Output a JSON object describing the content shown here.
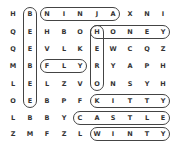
{
  "puzzle": {
    "type": "word-search",
    "rows": 8,
    "cols": 10,
    "grid": [
      [
        "H",
        "B",
        "N",
        "I",
        "N",
        "J",
        "A",
        "X",
        "N",
        "I"
      ],
      [
        "Q",
        "E",
        "H",
        "B",
        "O",
        "H",
        "O",
        "N",
        "E",
        "Y"
      ],
      [
        "Q",
        "E",
        "V",
        "L",
        "K",
        "E",
        "W",
        "C",
        "Q",
        "Z"
      ],
      [
        "M",
        "B",
        "F",
        "L",
        "Y",
        "R",
        "Y",
        "A",
        "P",
        "H"
      ],
      [
        "L",
        "E",
        "L",
        "Z",
        "V",
        "O",
        "N",
        "S",
        "Y",
        "H"
      ],
      [
        "O",
        "E",
        "B",
        "P",
        "F",
        "K",
        "I",
        "T",
        "T",
        "Y"
      ],
      [
        "L",
        "B",
        "B",
        "Y",
        "C",
        "A",
        "S",
        "T",
        "L",
        "E"
      ],
      [
        "Z",
        "M",
        "F",
        "Z",
        "L",
        "W",
        "I",
        "N",
        "T",
        "Y"
      ]
    ],
    "found_words": [
      {
        "word": "BEEBEE",
        "row": 0,
        "col": 1,
        "dir": "down",
        "len": 6
      },
      {
        "word": "NINJA",
        "row": 0,
        "col": 2,
        "dir": "right",
        "len": 5
      },
      {
        "word": "HERO",
        "row": 1,
        "col": 5,
        "dir": "down",
        "len": 4
      },
      {
        "word": "HONEY",
        "row": 1,
        "col": 5,
        "dir": "right",
        "len": 5
      },
      {
        "word": "FLY",
        "row": 3,
        "col": 2,
        "dir": "right",
        "len": 3
      },
      {
        "word": "KITTY",
        "row": 5,
        "col": 5,
        "dir": "right",
        "len": 5
      },
      {
        "word": "CASTLE",
        "row": 6,
        "col": 4,
        "dir": "right",
        "len": 6
      },
      {
        "word": "WINTY",
        "row": 7,
        "col": 5,
        "dir": "right",
        "len": 5
      }
    ]
  },
  "layout": {
    "col_x": [
      13,
      30,
      47,
      64,
      80,
      97,
      113,
      130,
      147,
      163
    ],
    "row_y": [
      14,
      32,
      49,
      66,
      84,
      101,
      118,
      134
    ]
  }
}
